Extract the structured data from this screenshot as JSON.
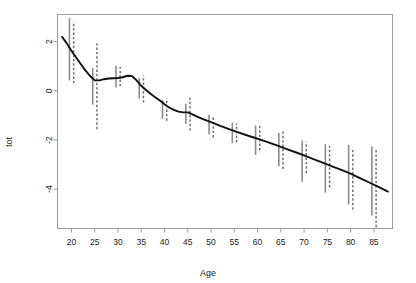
{
  "chart_data": {
    "type": "line",
    "title": "",
    "subtitle": "",
    "xlabel": "Age",
    "ylabel": "tot",
    "xlim": [
      17,
      89
    ],
    "ylim": [
      -5.6,
      3.1
    ],
    "grid": false,
    "legend": null,
    "xticks": [
      20,
      25,
      30,
      35,
      40,
      45,
      50,
      55,
      60,
      65,
      70,
      75,
      80,
      85
    ],
    "yticks": [
      2,
      0,
      -2,
      -4
    ],
    "xtick_labels": [
      "20",
      "25",
      "30",
      "35",
      "40",
      "45",
      "50",
      "55",
      "60",
      "65",
      "70",
      "75",
      "80",
      "85"
    ],
    "ytick_labels": [
      "2",
      "0",
      "-2",
      "-4"
    ],
    "series": [
      {
        "name": "smoothed fit",
        "style": "solid-black-curve",
        "color": "#111111",
        "x": [
          18,
          19,
          20,
          21,
          22,
          23,
          24,
          25,
          26,
          27,
          28,
          29,
          30,
          31,
          32,
          33,
          34,
          35,
          36,
          37,
          38,
          39,
          40,
          41,
          42,
          43,
          44,
          45,
          46,
          47,
          48,
          49,
          50,
          52,
          54,
          56,
          58,
          60,
          62,
          64,
          66,
          68,
          70,
          72,
          74,
          76,
          78,
          80,
          82,
          84,
          86,
          88
        ],
        "y": [
          2.19,
          1.92,
          1.63,
          1.35,
          1.09,
          0.83,
          0.6,
          0.42,
          0.42,
          0.47,
          0.5,
          0.51,
          0.52,
          0.55,
          0.61,
          0.6,
          0.42,
          0.2,
          0.03,
          -0.12,
          -0.26,
          -0.4,
          -0.55,
          -0.68,
          -0.78,
          -0.85,
          -0.88,
          -0.88,
          -0.96,
          -1.05,
          -1.13,
          -1.2,
          -1.28,
          -1.43,
          -1.57,
          -1.7,
          -1.83,
          -1.95,
          -2.08,
          -2.21,
          -2.35,
          -2.49,
          -2.63,
          -2.78,
          -2.92,
          -3.07,
          -3.22,
          -3.37,
          -3.55,
          -3.73,
          -3.91,
          -4.1
        ]
      }
    ],
    "error_bars": {
      "description": "Paired vertical interval bars at each 5-year age: a solid grey bar and a dashed grey bar slightly offset to the right",
      "solid_color": "#8c8c8c",
      "dashed_color": "#6e6e6e",
      "ages": [
        20,
        25,
        30,
        35,
        40,
        45,
        50,
        55,
        60,
        65,
        70,
        75,
        80,
        85
      ],
      "solid": [
        {
          "age": 20,
          "low": 0.42,
          "high": 2.95
        },
        {
          "age": 25,
          "low": -0.56,
          "high": 0.93
        },
        {
          "age": 30,
          "low": 0.13,
          "high": 1.02
        },
        {
          "age": 35,
          "low": -0.31,
          "high": 0.52
        },
        {
          "age": 40,
          "low": -1.14,
          "high": -0.37
        },
        {
          "age": 45,
          "low": -1.35,
          "high": -0.53
        },
        {
          "age": 50,
          "low": -1.78,
          "high": -0.98
        },
        {
          "age": 55,
          "low": -2.13,
          "high": -1.3
        },
        {
          "age": 60,
          "low": -2.61,
          "high": -1.41
        },
        {
          "age": 65,
          "low": -3.07,
          "high": -1.72
        },
        {
          "age": 70,
          "low": -3.7,
          "high": -2.02
        },
        {
          "age": 75,
          "low": -4.14,
          "high": -2.17
        },
        {
          "age": 80,
          "low": -4.62,
          "high": -2.2
        },
        {
          "age": 85,
          "low": -5.07,
          "high": -2.27
        }
      ],
      "dashed": [
        {
          "age": 20,
          "low": 0.3,
          "high": 2.82
        },
        {
          "age": 25,
          "low": -1.56,
          "high": 1.95
        },
        {
          "age": 30,
          "low": 0.18,
          "high": 0.97
        },
        {
          "age": 35,
          "low": -0.48,
          "high": 0.62
        },
        {
          "age": 40,
          "low": -1.22,
          "high": -0.3
        },
        {
          "age": 45,
          "low": -1.62,
          "high": -0.27
        },
        {
          "age": 50,
          "low": -1.9,
          "high": -1.09
        },
        {
          "age": 55,
          "low": -2.1,
          "high": -1.32
        },
        {
          "age": 60,
          "low": -2.42,
          "high": -1.4
        },
        {
          "age": 65,
          "low": -3.18,
          "high": -1.66
        },
        {
          "age": 70,
          "low": -3.35,
          "high": -2.07
        },
        {
          "age": 75,
          "low": -3.93,
          "high": -2.25
        },
        {
          "age": 80,
          "low": -4.83,
          "high": -2.35
        },
        {
          "age": 85,
          "low": -5.55,
          "high": -2.33
        }
      ]
    }
  }
}
